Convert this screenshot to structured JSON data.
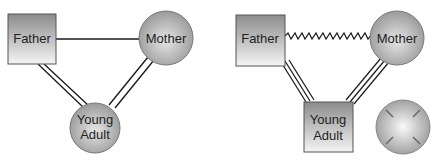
{
  "diagrams": [
    {
      "name": "left-genogram",
      "nodes": {
        "father": {
          "label": "Father",
          "shape": "square"
        },
        "mother": {
          "label": "Mother",
          "shape": "circle"
        },
        "young_adult": {
          "label_line1": "Young",
          "label_line2": "Adult",
          "shape": "circle"
        }
      },
      "edges": [
        {
          "from": "Father",
          "to": "Mother",
          "style": "single-line"
        },
        {
          "from": "Father",
          "to": "Young Adult",
          "style": "double-line"
        },
        {
          "from": "Mother",
          "to": "Young Adult",
          "style": "double-line"
        }
      ]
    },
    {
      "name": "right-genogram",
      "nodes": {
        "father": {
          "label": "Father",
          "shape": "square"
        },
        "mother": {
          "label": "Mother",
          "shape": "circle"
        },
        "young_adult": {
          "label_line1": "Young",
          "label_line2": "Adult",
          "shape": "square"
        },
        "unlabeled": {
          "shape": "circle-with-ticks"
        }
      },
      "edges": [
        {
          "from": "Father",
          "to": "Mother",
          "style": "zigzag"
        },
        {
          "from": "Father",
          "to": "Young Adult",
          "style": "triple-line"
        },
        {
          "from": "Mother",
          "to": "Young Adult",
          "style": "triple-line"
        }
      ]
    }
  ],
  "colors": {
    "node_dark": "#8f8f8f",
    "node_light": "#f2f2f2",
    "line": "#1a1a1a"
  }
}
